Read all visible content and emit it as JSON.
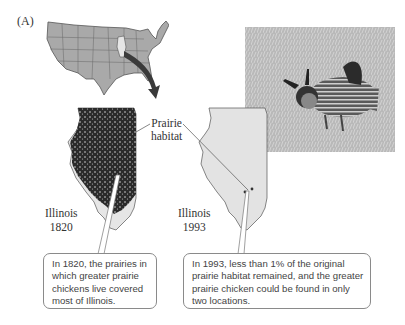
{
  "figure": {
    "panel_label": "(A)",
    "labels": {
      "prairie_habitat_line1": "Prairie",
      "prairie_habitat_line2": "habitat",
      "illinois_1820_name": "Illinois",
      "illinois_1820_year": "1820",
      "illinois_1993_name": "Illinois",
      "illinois_1993_year": "1993"
    },
    "callouts": [
      {
        "text": "In 1820, the prairies in which greater prairie chickens live covered most of Illinois."
      },
      {
        "text": "In 1993, less than 1% of the original prairie habitat remained, and the greater prairie chicken could be found in only two locations."
      }
    ],
    "images": {
      "us_map": "map of contiguous United States with Illinois highlighted",
      "photo": "photograph of a greater prairie chicken in grass"
    },
    "colors": {
      "us_map_fill": "#a9a9a9",
      "illinois_highlight": "#e6e6e6",
      "arrow": "#3a3a3a",
      "habitat_dark": "#2a2a2a",
      "illinois_1993_fill": "#e3e3e3",
      "callout_border": "#8a8a8a"
    }
  }
}
